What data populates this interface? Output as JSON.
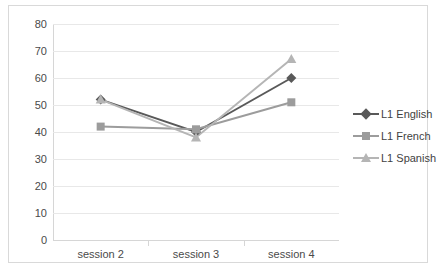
{
  "chart_data": {
    "type": "line",
    "title": "",
    "xlabel": "",
    "ylabel": "",
    "categories": [
      "session 2",
      "session 3",
      "session 4"
    ],
    "ylim": [
      0,
      80
    ],
    "ytick_values": [
      0,
      10,
      20,
      30,
      40,
      50,
      60,
      70,
      80
    ],
    "ytick_labels": [
      "0",
      "10",
      "20",
      "30",
      "40",
      "50",
      "60",
      "70",
      "80"
    ],
    "grid": true,
    "legend_position": "right",
    "series": [
      {
        "name": "L1 English",
        "marker": "diamond",
        "color": "#595959",
        "values": [
          52,
          40,
          60
        ]
      },
      {
        "name": "L1 French",
        "marker": "square",
        "color": "#9c9c9c",
        "values": [
          42,
          41,
          51
        ]
      },
      {
        "name": "L1 Spanish",
        "marker": "triangle",
        "color": "#b5b5b5",
        "values": [
          52,
          38,
          67
        ]
      }
    ]
  },
  "legend": {
    "items": [
      {
        "label": "L1 English"
      },
      {
        "label": "L1 French"
      },
      {
        "label": "L1 Spanish"
      }
    ]
  },
  "colors": {
    "frame_border": "#d9d9d9",
    "gridline": "#e8e8e8",
    "axis": "#d6d6d6",
    "tick_text": "#4a4a4a",
    "background": "#ffffff"
  }
}
